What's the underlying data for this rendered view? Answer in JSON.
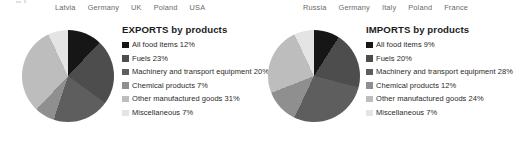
{
  "axis_rows": [
    {
      "name": "exports-country-axis",
      "ticks": [
        "Latvia",
        "Germany",
        "UK",
        "Poland",
        "USA"
      ]
    },
    {
      "name": "imports-country-axis",
      "ticks": [
        "Russia",
        "Germany",
        "Italy",
        "Poland",
        "France"
      ]
    }
  ],
  "palette": {
    "slice_1": "#161616",
    "slice_2": "#4d4d4d",
    "slice_3": "#5e5e5e",
    "slice_4": "#8f8f8f",
    "slice_5": "#bdbdbd",
    "slice_6": "#e4e4e4",
    "text": "#2c2a29",
    "axis_text": "#6d6a68",
    "background": "#ffffff"
  },
  "chart_data": [
    {
      "type": "pie",
      "name": "exports-pie",
      "title": "EXPORTS by products",
      "title_caps": "EXPORTS",
      "title_rest": " by products",
      "start_angle": 0,
      "direction": "clockwise",
      "unit": "%",
      "categories": [
        "All food items",
        "Fuels",
        "Machinery and transport equipment",
        "Chemical products",
        "Other manufactured goods",
        "Miscellaneous"
      ],
      "values": [
        12,
        23,
        20,
        7,
        31,
        7
      ],
      "legend": [
        {
          "label": "All food items 12%",
          "value": 12,
          "color": "#161616"
        },
        {
          "label": "Fuels 23%",
          "value": 23,
          "color": "#4d4d4d"
        },
        {
          "label": "Machinery and transport equipment 20%",
          "value": 20,
          "color": "#5e5e5e"
        },
        {
          "label": "Chemical products 7%",
          "value": 7,
          "color": "#8f8f8f"
        },
        {
          "label": "Other manufactured goods 31%",
          "value": 31,
          "color": "#bdbdbd"
        },
        {
          "label": "Miscellaneous 7%",
          "value": 7,
          "color": "#e4e4e4"
        }
      ],
      "legend_position": "right"
    },
    {
      "type": "pie",
      "name": "imports-pie",
      "title": "IMPORTS by products",
      "title_caps": "IMPORTS",
      "title_rest": " by products",
      "start_angle": 0,
      "direction": "clockwise",
      "unit": "%",
      "categories": [
        "All food items",
        "Fuels",
        "Machinery and transport equipment",
        "Chemical products",
        "Other manufactured goods",
        "Miscellaneous"
      ],
      "values": [
        9,
        20,
        28,
        12,
        24,
        7
      ],
      "legend": [
        {
          "label": "All food items 9%",
          "value": 9,
          "color": "#161616"
        },
        {
          "label": "Fuels 20%",
          "value": 20,
          "color": "#4d4d4d"
        },
        {
          "label": "Machinery and transport equipment 28%",
          "value": 28,
          "color": "#5e5e5e"
        },
        {
          "label": "Chemical products 12%",
          "value": 12,
          "color": "#8f8f8f"
        },
        {
          "label": "Other manufactured goods 24%",
          "value": 24,
          "color": "#bdbdbd"
        },
        {
          "label": "Miscellaneous 7%",
          "value": 7,
          "color": "#e4e4e4"
        }
      ],
      "legend_position": "right"
    }
  ]
}
